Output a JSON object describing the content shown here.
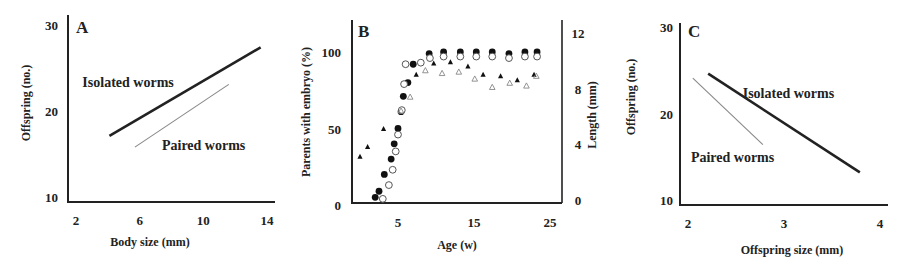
{
  "figure": {
    "background": "#ffffff",
    "ink": "#222222",
    "light_line": "#888888"
  },
  "chart_data": [
    {
      "panel": "A",
      "type": "line",
      "xlabel": "Body size (mm)",
      "ylabel": "Offspring (no.)",
      "xlim": [
        2,
        14
      ],
      "ylim": [
        10,
        30
      ],
      "xticks": [
        2,
        6,
        10,
        14
      ],
      "yticks": [
        10,
        20,
        30
      ],
      "grid": false,
      "series": [
        {
          "name": "Isolated worms",
          "style": "thick-dark",
          "x": [
            4.1,
            13.6
          ],
          "y": [
            17.1,
            27.4
          ]
        },
        {
          "name": "Paired worms",
          "style": "thin-grey",
          "x": [
            5.7,
            11.6
          ],
          "y": [
            15.8,
            23.1
          ]
        }
      ],
      "annotations": [
        {
          "text": "Isolated worms",
          "x": 2.4,
          "y": 23.4
        },
        {
          "text": "Paired worms",
          "x": 7.4,
          "y": 16.0
        }
      ]
    },
    {
      "panel": "B",
      "type": "scatter",
      "xlabel": "Age (w)",
      "ylabel": "Parents with embryo (%)",
      "y2label": "Length (mm)",
      "xlim": [
        0,
        25
      ],
      "ylim": [
        0,
        100
      ],
      "y2lim": [
        0,
        12
      ],
      "xticks": [
        5,
        15,
        25
      ],
      "yticks": [
        0,
        50,
        100
      ],
      "y2ticks": [
        0,
        4,
        8,
        12
      ],
      "grid": false,
      "series": [
        {
          "name": "Parents with embryo (filled circles)",
          "marker": "filled-circle",
          "axis": "left",
          "x": [
            2.0,
            2.5,
            3.2,
            4.1,
            4.5,
            5.0,
            5.4,
            5.7,
            6.3,
            7.0,
            9.1,
            11.0,
            13.2,
            15.3,
            17.4,
            19.6,
            21.7,
            23.3
          ],
          "y": [
            5,
            9,
            20,
            30,
            40,
            50,
            61,
            71,
            80,
            92,
            99,
            100,
            100,
            100,
            100,
            99,
            100,
            100
          ]
        },
        {
          "name": "Parents with embryo (open circles)",
          "marker": "open-circle",
          "axis": "left",
          "x": [
            3.0,
            3.8,
            4.3,
            4.7,
            5.0,
            5.5,
            5.8,
            6.0,
            8.0,
            9.2,
            11.0,
            13.2,
            15.3,
            17.4,
            19.6,
            21.7,
            23.3
          ],
          "y": [
            5,
            14,
            24,
            36,
            47,
            63,
            80,
            93,
            94,
            97,
            98,
            98,
            98,
            98,
            97,
            98,
            98
          ]
        },
        {
          "name": "Length (filled triangles)",
          "marker": "filled-triangle",
          "axis": "right",
          "x": [
            0.0,
            1.0,
            3.1,
            7.4,
            9.7,
            11.9,
            14.2,
            16.2,
            18.5,
            20.7,
            22.9
          ],
          "y": [
            3.1,
            3.8,
            5.1,
            9.0,
            9.8,
            9.9,
            9.6,
            9.0,
            8.9,
            8.6,
            9.0
          ]
        },
        {
          "name": "Length (open triangles)",
          "marker": "open-triangle",
          "axis": "right",
          "x": [
            5.4,
            6.6,
            8.6,
            10.8,
            13.0,
            15.1,
            17.4,
            19.7,
            21.9,
            23.2
          ],
          "y": [
            6.4,
            7.4,
            9.3,
            9.1,
            9.2,
            8.7,
            8.1,
            8.4,
            8.2,
            8.9
          ]
        }
      ]
    },
    {
      "panel": "C",
      "type": "line",
      "xlabel": "Offspring size (mm)",
      "ylabel": "Offspring (no.)",
      "xlim": [
        2,
        4
      ],
      "ylim": [
        10,
        30
      ],
      "xticks": [
        2,
        3,
        4
      ],
      "yticks": [
        10,
        20,
        30
      ],
      "grid": false,
      "series": [
        {
          "name": "Isolated worms",
          "style": "thick-dark",
          "x": [
            2.21,
            3.79
          ],
          "y": [
            24.6,
            13.2
          ]
        },
        {
          "name": "Paired worms",
          "style": "thin-grey",
          "x": [
            2.05,
            2.78
          ],
          "y": [
            24.1,
            16.4
          ]
        }
      ],
      "annotations": [
        {
          "text": "Isolated worms",
          "x": 2.57,
          "y": 22.4
        },
        {
          "text": "Paired worms",
          "x": 2.03,
          "y": 15.0
        }
      ]
    }
  ]
}
